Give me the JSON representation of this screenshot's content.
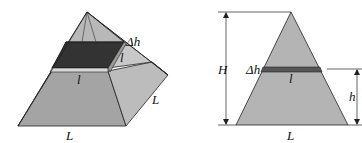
{
  "figure": {
    "left": {
      "title": "square-pyramid-with-slab",
      "labels": {
        "delta_h": "Δh",
        "l_side": "l",
        "l_front": "l",
        "L_right": "L",
        "L_bottom": "L"
      }
    },
    "right": {
      "title": "triangle-cross-section",
      "labels": {
        "H": "H",
        "delta_h": "Δh",
        "l": "l",
        "h": "h",
        "L": "L"
      }
    },
    "colors": {
      "face_light": "#bdbdbd",
      "face_mid": "#a6a6a6",
      "face_dark": "#8c8c8c",
      "slab": "#3a3a3a",
      "line": "#222222"
    }
  }
}
